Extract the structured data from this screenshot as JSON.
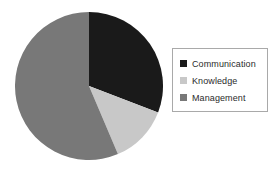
{
  "figure": {
    "background_color": "#ffffff",
    "width": 278,
    "height": 169
  },
  "chart_data": {
    "type": "pie",
    "title": "",
    "subtitle": "",
    "xlabel": "",
    "ylabel": "",
    "grid": false,
    "legend_position": "right",
    "start_angle_deg": 0,
    "direction": "clockwise",
    "center": {
      "x": 89,
      "y": 86
    },
    "radius": 74,
    "categories": [
      "Communication",
      "Knowledge",
      "Management"
    ],
    "values": [
      31,
      13,
      56
    ],
    "value_unit": "percent",
    "slice_angles_deg": [
      111,
      46,
      203
    ],
    "colors": [
      "#1a1a1a",
      "#c8c8c8",
      "#787878"
    ],
    "slices": [
      {
        "label": "Communication",
        "value": 31,
        "angle_deg": 111,
        "start_deg": 0,
        "end_deg": 111,
        "color": "#1a1a1a"
      },
      {
        "label": "Knowledge",
        "value": 13,
        "angle_deg": 46,
        "start_deg": 111,
        "end_deg": 157,
        "color": "#c8c8c8"
      },
      {
        "label": "Management",
        "value": 56,
        "angle_deg": 203,
        "start_deg": 157,
        "end_deg": 360,
        "color": "#787878"
      }
    ]
  },
  "legend": {
    "border_color": "#a9a9a9",
    "background_color": "#ffffff",
    "entries": [
      {
        "label": "Communication",
        "color": "#1a1a1a",
        "swatch_icon": "square-swatch-icon"
      },
      {
        "label": "Knowledge",
        "color": "#c8c8c8",
        "swatch_icon": "square-swatch-icon"
      },
      {
        "label": "Management",
        "color": "#787878",
        "swatch_icon": "square-swatch-icon"
      }
    ]
  }
}
